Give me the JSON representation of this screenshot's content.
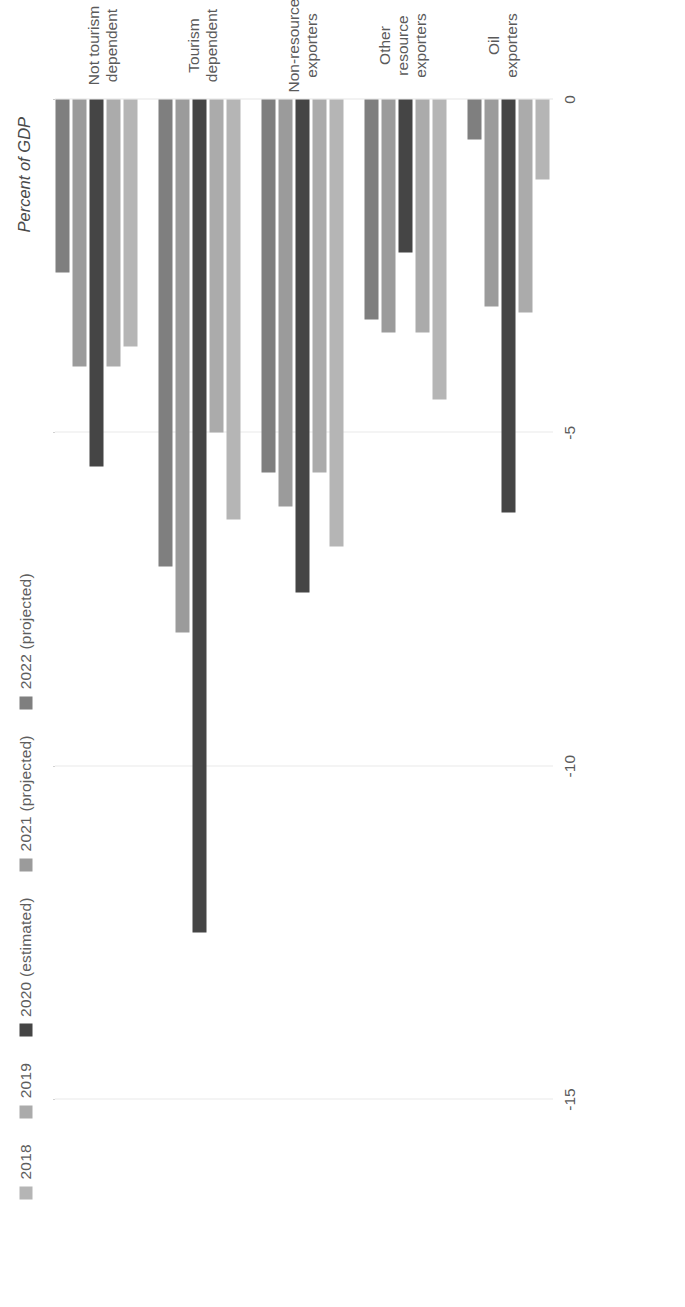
{
  "chart_data": {
    "type": "bar",
    "orientation": "horizontal",
    "title": "",
    "xlabel": "Percent of GDP",
    "ylabel": "",
    "axis_title": "Percent of GDP",
    "categories": [
      "Oil\nexporters",
      "Other resource\nexporters",
      "Non-resource\nexporters",
      "Tourism\ndependent",
      "Not tourism\ndependent"
    ],
    "series": [
      {
        "name": "2018",
        "color": "#b5b5b5",
        "values": [
          -1.2,
          -4.5,
          -6.7,
          -6.3,
          -3.7
        ]
      },
      {
        "name": "2019",
        "color": "#ababab",
        "values": [
          -3.2,
          -3.5,
          -5.6,
          -5.0,
          -4.0
        ]
      },
      {
        "name": "2020 (estimated)",
        "color": "#454545",
        "values": [
          -6.2,
          -2.3,
          -7.4,
          -12.5,
          -5.5
        ]
      },
      {
        "name": "2021 (projected)",
        "color": "#9b9b9b",
        "values": [
          -3.1,
          -3.5,
          -6.1,
          -8.0,
          -4.0
        ]
      },
      {
        "name": "2022 (projected)",
        "color": "#7f7f7f",
        "values": [
          -0.6,
          -3.3,
          -5.6,
          -7.0,
          -2.6
        ]
      }
    ],
    "xticks": [
      0,
      -5,
      -10,
      -15
    ],
    "xtick_labels": [
      "0",
      "-5",
      "-10",
      "-15"
    ],
    "xlim": [
      -16.5,
      0
    ],
    "grid": true,
    "legend_position": "top-left",
    "gridline_color": "#d2d2d2",
    "text_color": "#5a5a5a"
  }
}
